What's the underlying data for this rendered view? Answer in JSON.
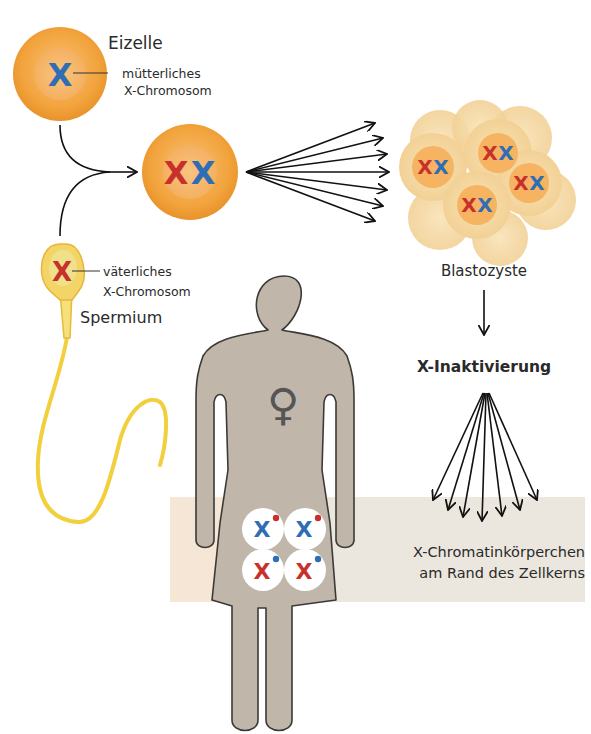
{
  "labels": {
    "egg": "Eizelle",
    "maternal_x_line1": "mütterliches",
    "maternal_x_line2": "X-Chromosom",
    "paternal_x_line1": "väterliches",
    "paternal_x_line2": "X-Chromosom",
    "sperm": "Spermium",
    "blastocyst": "Blastozyste",
    "x_inactivation": "X-Inaktivierung",
    "barr_body_line1": "X-Chromatinkörperchen",
    "barr_body_line2": "am Rand des Zellkerns"
  },
  "chromosomes": {
    "maternal": "X",
    "paternal": "X",
    "female_symbol": "♀"
  },
  "colors": {
    "maternal_blue": "#2f6db5",
    "paternal_red": "#c8312b",
    "cell_orange": "#f2a640",
    "cell_nucleus": "#f7b968",
    "blastocyst_cell": "#f6d9a3",
    "sperm_yellow": "#f2cf3c",
    "body_gray": "#bfb6a9",
    "band_beige": "#ece6dc"
  },
  "adult_cells": [
    {
      "active": "X",
      "active_color": "blue",
      "barr_dot": "red"
    },
    {
      "active": "X",
      "active_color": "blue",
      "barr_dot": "red"
    },
    {
      "active": "X",
      "active_color": "red",
      "barr_dot": "blue"
    },
    {
      "active": "X",
      "active_color": "red",
      "barr_dot": "blue"
    }
  ]
}
